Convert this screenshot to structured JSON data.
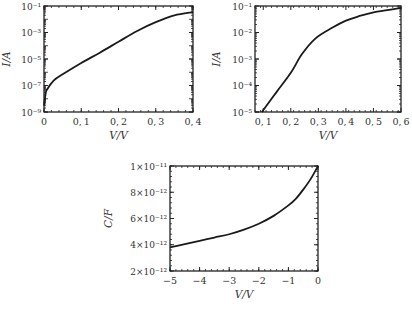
{
  "chart_data": [
    {
      "type": "line",
      "id": "iv-forward-1",
      "title": "",
      "xlabel": "V/V",
      "ylabel": "I/A",
      "yscale": "log",
      "xlim": [
        0,
        0.4
      ],
      "ylim": [
        1e-09,
        0.1
      ],
      "xticks": [
        "0",
        "0.1",
        "0.2",
        "0.3",
        "0.4"
      ],
      "yticks": [
        "10⁻⁹",
        "10⁻⁷",
        "10⁻⁵",
        "10⁻³",
        "10⁻¹"
      ],
      "grid": false,
      "series": [
        {
          "name": "I-V",
          "x": [
            0.0,
            0.005,
            0.01,
            0.02,
            0.03,
            0.05,
            0.1,
            0.15,
            0.2,
            0.25,
            0.3,
            0.35,
            0.4
          ],
          "y": [
            3e-09,
            3e-08,
            6e-08,
            1.5e-07,
            3e-07,
            7e-07,
            5e-06,
            3e-05,
            0.0002,
            0.0013,
            0.006,
            0.02,
            0.035
          ]
        }
      ]
    },
    {
      "type": "line",
      "id": "iv-forward-2",
      "title": "",
      "xlabel": "V/V",
      "ylabel": "I/A",
      "yscale": "log",
      "xlim": [
        0.07,
        0.6
      ],
      "ylim": [
        1e-05,
        0.1
      ],
      "xticks": [
        "0.1",
        "0.2",
        "0.3",
        "0.4",
        "0.5",
        "0.6"
      ],
      "yticks": [
        "10⁻⁵",
        "10⁻⁴",
        "10⁻³",
        "10⁻²",
        "10⁻¹"
      ],
      "grid": false,
      "series": [
        {
          "name": "I-V",
          "x": [
            0.095,
            0.15,
            0.2,
            0.24,
            0.29,
            0.35,
            0.4,
            0.45,
            0.5,
            0.55,
            0.6
          ],
          "y": [
            1e-05,
            6e-05,
            0.0003,
            0.0015,
            0.006,
            0.015,
            0.028,
            0.042,
            0.058,
            0.07,
            0.085
          ]
        }
      ]
    },
    {
      "type": "line",
      "id": "cv-reverse",
      "title": "",
      "xlabel": "V/V",
      "ylabel": "C/F",
      "yscale": "linear",
      "xlim": [
        -5,
        0
      ],
      "ylim": [
        2e-12,
        1e-11
      ],
      "xticks": [
        "-5",
        "-4",
        "-3",
        "-2",
        "-1",
        "0"
      ],
      "yticks": [
        "2×10⁻¹²",
        "4×10⁻¹²",
        "6×10⁻¹²",
        "8×10⁻¹²",
        "1×10⁻¹¹"
      ],
      "grid": false,
      "series": [
        {
          "name": "C-V",
          "x": [
            -5,
            -4.5,
            -4,
            -3.5,
            -3,
            -2.5,
            -2,
            -1.5,
            -1,
            -0.75,
            -0.5,
            -0.25,
            0
          ],
          "y": [
            3.8e-12,
            4.05e-12,
            4.3e-12,
            4.55e-12,
            4.8e-12,
            5.15e-12,
            5.6e-12,
            6.2e-12,
            7e-12,
            7.5e-12,
            8.2e-12,
            9e-12,
            1e-11
          ]
        }
      ]
    }
  ]
}
